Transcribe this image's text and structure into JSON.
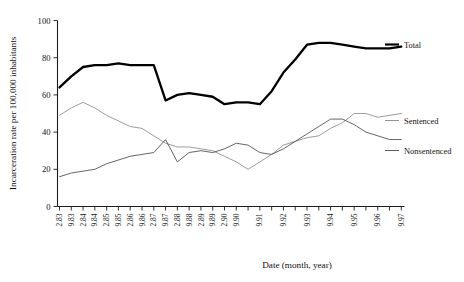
{
  "chart_data": {
    "type": "line",
    "title": "",
    "xlabel": "Date (month, year)",
    "ylabel": "Incarceration rate per 100,000 inhabitants",
    "ylim": [
      0,
      100
    ],
    "yticks": [
      0,
      20,
      40,
      60,
      80,
      100
    ],
    "grid": false,
    "legend_position": "right",
    "categories": [
      "2.83",
      "9.83",
      "2.84",
      "9.84",
      "2.85",
      "9.85",
      "2.86",
      "9.86",
      "2.87",
      "9.87",
      "2.88",
      "9.88",
      "2.89",
      "9.89",
      "2.90",
      "9.90",
      "2.91",
      "9.91",
      "2.92",
      "9.92",
      "2.93",
      "9.93",
      "2.94",
      "9.94",
      "2.95",
      "9.95",
      "2.96",
      "9.96",
      "2.97",
      "9.97"
    ],
    "tick_labels": [
      "2.83",
      "9.83",
      "2.84",
      "9.84",
      "2.85",
      "9.85",
      "2.86",
      "9.86",
      "2.87",
      "9.87",
      "2.88",
      "9.88",
      "2.89",
      "9.89",
      "2.90",
      "9.90",
      "",
      "9.91",
      "",
      "9.92",
      "",
      "9.93",
      "",
      "9.94",
      "",
      "9.95",
      "",
      "9.96",
      "",
      "9.97"
    ],
    "series": [
      {
        "name": "Total",
        "color": "#000000",
        "style": "thick-solid",
        "values": [
          64,
          70,
          75,
          76,
          76,
          77,
          76,
          76,
          76,
          57,
          60,
          61,
          60,
          59,
          55,
          56,
          56,
          55,
          62,
          72,
          79,
          87,
          88,
          88,
          87,
          86,
          85,
          85,
          85,
          86
        ]
      },
      {
        "name": "Sentenced",
        "color": "#8a8a8a",
        "style": "thin-solid",
        "values": [
          49,
          53,
          56,
          53,
          49,
          46,
          43,
          42,
          38,
          34,
          32,
          32,
          31,
          30,
          27,
          24,
          20,
          24,
          28,
          33,
          35,
          37,
          38,
          42,
          45,
          50,
          50,
          48,
          49,
          50
        ]
      },
      {
        "name": "Nonsentenced",
        "color": "#4a4a4a",
        "style": "thin-solid",
        "values": [
          16,
          18,
          19,
          20,
          23,
          25,
          27,
          28,
          29,
          36,
          24,
          29,
          30,
          29,
          31,
          34,
          33,
          29,
          28,
          31,
          35,
          39,
          43,
          47,
          47,
          44,
          40,
          38,
          36,
          36
        ]
      }
    ]
  },
  "axis": {
    "x_title": "Date (month, year)",
    "y_title": "Incarceration rate per 100,000 inhabitants",
    "y_tick_labels": [
      "100",
      "80",
      "60",
      "40",
      "20",
      "0"
    ]
  },
  "legend": {
    "items": [
      {
        "label": "Total"
      },
      {
        "label": "Sentenced"
      },
      {
        "label": "Nonsentenced"
      }
    ]
  }
}
